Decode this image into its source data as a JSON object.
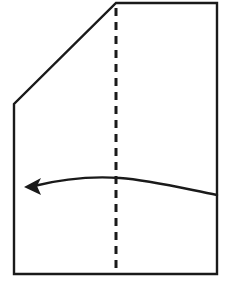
{
  "diagram": {
    "type": "instructional-fold-diagram",
    "canvas": {
      "width": 228,
      "height": 283,
      "background": "#ffffff"
    },
    "paper": {
      "name": "paper-sheet",
      "description": "Square sheet of paper with upper-left corner folded down, shown as a cut diagonal edge",
      "stroke_color": "#1a1a1a",
      "stroke_width": 2.4,
      "fill_color": "#ffffff",
      "points": "116,3 217,3 217,274 14,274 14,104",
      "vertices": [
        {
          "name": "top-left-of-cut",
          "x": 116,
          "y": 3
        },
        {
          "name": "top-right",
          "x": 217,
          "y": 3
        },
        {
          "name": "bottom-right",
          "x": 217,
          "y": 274
        },
        {
          "name": "bottom-left",
          "x": 14,
          "y": 274
        },
        {
          "name": "left-diagonal-base",
          "x": 14,
          "y": 104
        }
      ]
    },
    "crease": {
      "name": "vertical-center-crease",
      "description": "Dashed vertical valley-fold crease line down the middle of the sheet",
      "style": "dashed",
      "stroke_color": "#1a1a1a",
      "stroke_width": 3,
      "dash_pattern": "8 6",
      "x": 116,
      "y_start": 8,
      "y_end": 268
    },
    "arrow": {
      "name": "fold-direction-arrow",
      "description": "Curved arrow sweeping from the right edge leftward across the crease, indicating the right half folds over to the left",
      "direction": "right-to-left",
      "stroke_color": "#1a1a1a",
      "stroke_width": 2.4,
      "path": "M 217 195 C 186 189, 150 180, 120 178 C 90 176, 58 180, 34 186",
      "start_point": {
        "x": 217,
        "y": 195
      },
      "end_point": {
        "x": 24,
        "y": 187
      },
      "head": {
        "name": "arrowhead",
        "points": "24,187 41,178 37,186 41,195",
        "tip": {
          "x": 24,
          "y": 187
        }
      }
    }
  }
}
